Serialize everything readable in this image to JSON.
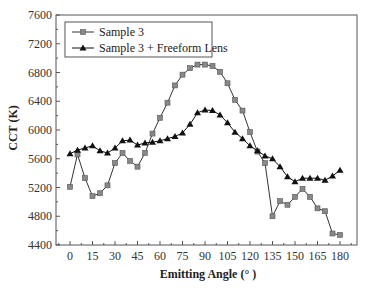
{
  "chart_data": {
    "type": "line",
    "title": "",
    "xlabel": "Emitting Angle (°)",
    "ylabel": "CCT (K)",
    "xlim": [
      -10,
      190
    ],
    "ylim": [
      4400,
      7600
    ],
    "grid": false,
    "legend_position": "upper-left",
    "x_ticks": [
      0,
      15,
      30,
      45,
      60,
      75,
      90,
      105,
      120,
      135,
      150,
      165,
      180
    ],
    "y_ticks": [
      4400,
      4800,
      5200,
      5600,
      6000,
      6400,
      6800,
      7200,
      7600
    ],
    "x": [
      0,
      5,
      10,
      15,
      20,
      25,
      30,
      35,
      40,
      45,
      50,
      55,
      60,
      65,
      70,
      75,
      80,
      85,
      90,
      95,
      100,
      105,
      110,
      115,
      120,
      125,
      130,
      135,
      140,
      145,
      150,
      155,
      160,
      165,
      170,
      175,
      180
    ],
    "series": [
      {
        "name": "Sample 3",
        "marker": "square",
        "color": "#333333",
        "marker_color": "#888888",
        "values": [
          5210,
          5660,
          5330,
          5080,
          5120,
          5230,
          5540,
          5680,
          5570,
          5490,
          5680,
          5950,
          6170,
          6380,
          6620,
          6770,
          6860,
          6910,
          6910,
          6890,
          6810,
          6650,
          6420,
          6270,
          5970,
          5700,
          5540,
          4800,
          5010,
          4960,
          5070,
          5180,
          5070,
          4910,
          4870,
          4560,
          4540
        ]
      },
      {
        "name": "Sample 3 + Freeform Lens",
        "marker": "triangle",
        "color": "#111111",
        "marker_color": "#111111",
        "values": [
          5670,
          5720,
          5750,
          5780,
          5710,
          5680,
          5750,
          5850,
          5860,
          5790,
          5820,
          5830,
          5850,
          5880,
          5910,
          5960,
          6080,
          6240,
          6280,
          6270,
          6210,
          6100,
          5970,
          5880,
          5780,
          5710,
          5640,
          5600,
          5490,
          5350,
          5280,
          5330,
          5330,
          5330,
          5300,
          5360,
          5440
        ]
      }
    ]
  },
  "legend": {
    "items": [
      {
        "label": "Sample 3"
      },
      {
        "label": "Sample 3 + Freeform Lens"
      }
    ]
  },
  "axes": {
    "xlabel": "Emitting Angle (° )",
    "ylabel": "CCT (K)"
  }
}
